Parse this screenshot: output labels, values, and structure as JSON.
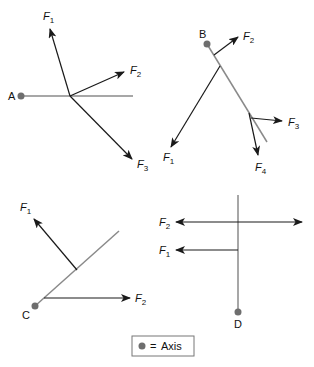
{
  "diagrams": {
    "a": {
      "axis_label": "A",
      "forces": [
        "F1",
        "F2",
        "F3"
      ]
    },
    "b": {
      "axis_label": "B",
      "forces": [
        "F1",
        "F2",
        "F3",
        "F4"
      ]
    },
    "c": {
      "axis_label": "C",
      "forces": [
        "F1",
        "F2"
      ]
    },
    "d": {
      "axis_label": "D",
      "forces": [
        "F1",
        "F2"
      ]
    }
  },
  "labels": {
    "F": "F",
    "s1": "1",
    "s2": "2",
    "s3": "3",
    "s4": "4"
  },
  "legend": {
    "symbol": "●",
    "equals": "=",
    "text": "Axis"
  },
  "colors": {
    "axis_line": "#8a8a8a",
    "axis_dot": "#6e6e6e",
    "arrow": "#1a1a1a"
  }
}
